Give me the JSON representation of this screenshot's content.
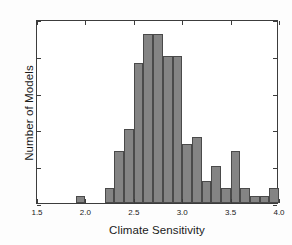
{
  "chart_data": {
    "type": "bar",
    "title": "",
    "xlabel": "Climate Sensitivity",
    "ylabel": "Number of Models",
    "xlim": [
      1.5,
      4.0
    ],
    "ylim": [
      0,
      25
    ],
    "grid": false,
    "legend": null,
    "bin_width": 0.1,
    "bar_color": "#848484",
    "edge_color": "#4a4a4a",
    "xticks": [
      1.5,
      2.0,
      2.5,
      3.0,
      3.5,
      4.0
    ],
    "xtick_labels": [
      "1.5",
      "2.0",
      "2.5",
      "3.0",
      "3.5",
      "4.0"
    ],
    "yticks": [
      0,
      5,
      10,
      15,
      20,
      25
    ],
    "ytick_labels": [
      "0",
      "5",
      "10",
      "15",
      "20",
      "25"
    ],
    "bins": [
      {
        "x0": 1.5,
        "x1": 1.6,
        "value": 0
      },
      {
        "x0": 1.6,
        "x1": 1.7,
        "value": 0
      },
      {
        "x0": 1.7,
        "x1": 1.8,
        "value": 0
      },
      {
        "x0": 1.8,
        "x1": 1.9,
        "value": 0
      },
      {
        "x0": 1.9,
        "x1": 2.0,
        "value": 1
      },
      {
        "x0": 2.0,
        "x1": 2.1,
        "value": 0
      },
      {
        "x0": 2.1,
        "x1": 2.2,
        "value": 0
      },
      {
        "x0": 2.2,
        "x1": 2.3,
        "value": 2
      },
      {
        "x0": 2.3,
        "x1": 2.4,
        "value": 7
      },
      {
        "x0": 2.4,
        "x1": 2.5,
        "value": 10
      },
      {
        "x0": 2.5,
        "x1": 2.6,
        "value": 19
      },
      {
        "x0": 2.6,
        "x1": 2.7,
        "value": 23
      },
      {
        "x0": 2.7,
        "x1": 2.8,
        "value": 23
      },
      {
        "x0": 2.8,
        "x1": 2.9,
        "value": 20
      },
      {
        "x0": 2.9,
        "x1": 3.0,
        "value": 20
      },
      {
        "x0": 3.0,
        "x1": 3.1,
        "value": 8
      },
      {
        "x0": 3.1,
        "x1": 3.2,
        "value": 9
      },
      {
        "x0": 3.2,
        "x1": 3.3,
        "value": 3
      },
      {
        "x0": 3.3,
        "x1": 3.4,
        "value": 5
      },
      {
        "x0": 3.4,
        "x1": 3.5,
        "value": 2
      },
      {
        "x0": 3.5,
        "x1": 3.6,
        "value": 7
      },
      {
        "x0": 3.6,
        "x1": 3.7,
        "value": 2
      },
      {
        "x0": 3.7,
        "x1": 3.8,
        "value": 1
      },
      {
        "x0": 3.8,
        "x1": 3.9,
        "value": 1
      },
      {
        "x0": 3.9,
        "x1": 4.0,
        "value": 2
      }
    ]
  }
}
